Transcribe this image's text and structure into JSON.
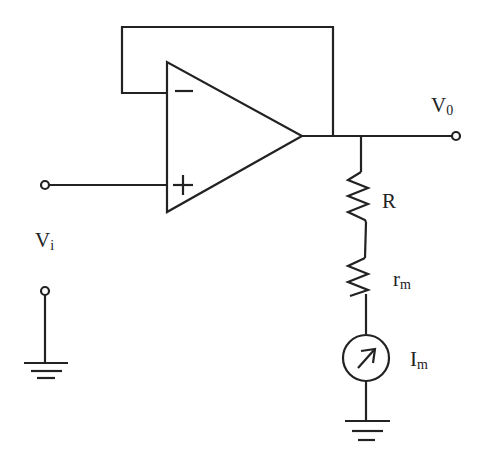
{
  "diagram": {
    "type": "circuit",
    "title": "",
    "components": [
      {
        "id": "opamp",
        "kind": "operational-amplifier",
        "inputs": [
          "-",
          "+"
        ],
        "config": "voltage-follower (output fed back to inverting input)"
      },
      {
        "id": "R",
        "kind": "resistor",
        "label": "R"
      },
      {
        "id": "rm",
        "kind": "resistor",
        "label_main": "r",
        "label_sub": "m"
      },
      {
        "id": "Im",
        "kind": "current-meter/current-source",
        "label_main": "I",
        "label_sub": "m"
      },
      {
        "id": "gnd1",
        "kind": "ground"
      },
      {
        "id": "gnd2",
        "kind": "ground"
      }
    ],
    "labels": {
      "minus": "−",
      "plus": "+",
      "vi_main": "V",
      "vi_sub": "i",
      "vo_main": "V",
      "vo_sub": "0",
      "r": "R",
      "rm_main": "r",
      "rm_sub": "m",
      "im_main": "I",
      "im_sub": "m"
    },
    "connections": [
      "Vi terminal -> opamp non-inverting (+) input",
      "opamp output -> inverting (-) input (feedback loop)",
      "opamp output -> Vo terminal",
      "output node -> R -> rm -> Im -> ground",
      "Vi reference terminal -> ground"
    ]
  }
}
